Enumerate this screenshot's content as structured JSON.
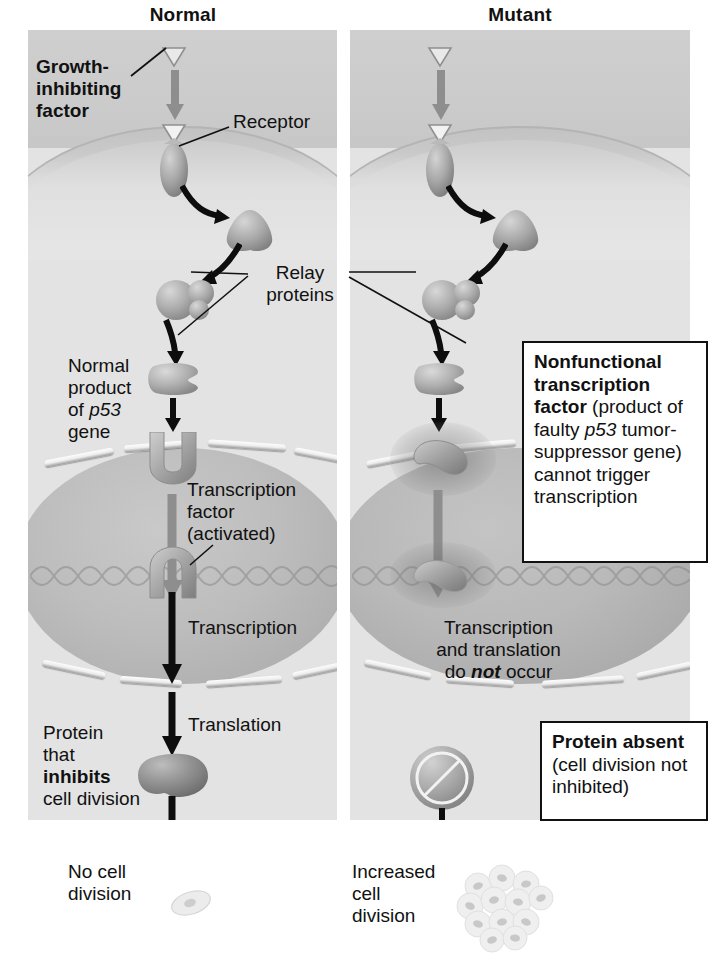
{
  "figure": {
    "type": "biology-diagram"
  },
  "columns": {
    "normal": {
      "title": "Normal"
    },
    "mutant": {
      "title": "Mutant"
    }
  },
  "normal_panel": {
    "growth_factor_label": {
      "line1": "Growth-",
      "line2": "inhibiting",
      "line3": "factor"
    },
    "receptor_label": "Receptor",
    "p53_product_label": {
      "line1": "Normal",
      "line2": "product",
      "line3_pre": "of ",
      "line3_italic": "p53",
      "line4": "gene"
    },
    "transcription_factor_label": {
      "line1": "Transcription",
      "line2": "factor",
      "line3": "(activated)"
    },
    "transcription_label": "Transcription",
    "translation_label": "Translation",
    "protein_label": {
      "line1": "Protein",
      "line2": "that",
      "line3_bold": "inhibits",
      "line4": "cell division"
    },
    "outcome_label": {
      "line1": "No cell",
      "line2": "division"
    }
  },
  "mutant_panel": {
    "nonfunctional_callout": {
      "bold_part": "Nonfunctional transcription factor",
      "rest_pre": " (product of faulty ",
      "italic_gene": "p53",
      "rest_post": " tumor-suppressor gene) cannot trigger transcription"
    },
    "no_transcription_label": {
      "line1": "Transcription",
      "line2": "and translation",
      "line3_pre": "do ",
      "line3_bold_italic": "not",
      "line3_post": " occur"
    },
    "protein_absent_callout": {
      "bold_part": "Protein absent",
      "rest": " (cell division not inhibited)"
    },
    "outcome_label": {
      "line1": "Increased",
      "line2": "cell",
      "line3": "division"
    }
  },
  "shared": {
    "relay_proteins_label": {
      "line1": "Relay",
      "line2": "proteins"
    }
  },
  "colors": {
    "background": "#ffffff",
    "panel_extracellular": "#cbcbcb",
    "panel_cytoplasm": "#e3e3e3",
    "nucleus": "#b5b5b5",
    "text": "#111111",
    "arrow_black": "#0d0d0d",
    "arrow_grey": "#8e8e8e",
    "protein_fill": "#a9a9a9"
  },
  "icons": {
    "ligand": "triangle-ligand-icon",
    "receptor": "receptor-protein-icon",
    "relay": "relay-protein-icon",
    "transcription_factor": "transcription-factor-icon",
    "nonfunctional_tf": "nonfunctional-transcription-factor-icon",
    "protein_blob": "inhibitor-protein-icon",
    "protein_absent": "prohibition-circle-icon",
    "single_cell": "single-cell-icon",
    "cell_cluster": "tumor-cell-cluster-icon",
    "dna": "dna-double-helix-icon"
  }
}
